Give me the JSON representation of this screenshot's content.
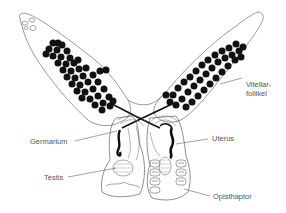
{
  "figure": {
    "labels": {
      "vitellarfollikel_line1": "Vitellar-",
      "vitellarfollikel_line2": "follikel",
      "germarium": "Germarium",
      "uterus": "Uterus",
      "testis": "Testis",
      "opisthaptor": "Opisthaptor"
    },
    "colors": {
      "outline": "#444444",
      "follicle": "#111111",
      "label_text": "#555555",
      "leader_line": "#444444"
    }
  }
}
